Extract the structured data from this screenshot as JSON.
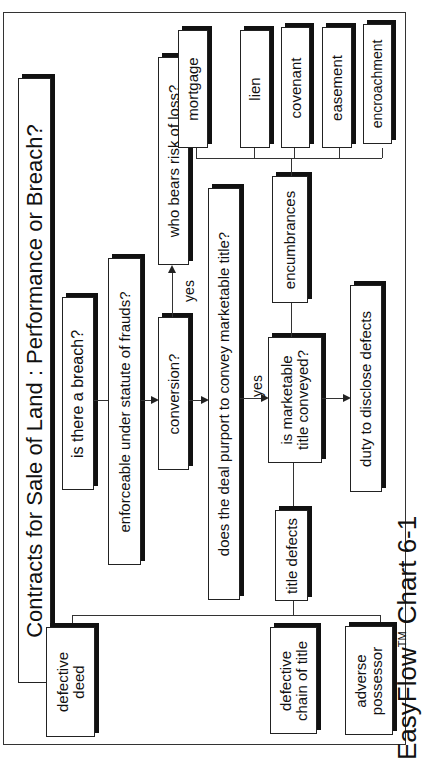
{
  "diagram": {
    "title": "Contracts for Sale of Land : Performance or Breach?",
    "orientation": "rotated -90deg (text reads bottom to top)",
    "nodes": {
      "breach": "is there a breach?",
      "statute_of_frauds": "enforceable under statute of frauds?",
      "conversion": "conversion?",
      "risk_of_loss": "who bears risk of loss?",
      "purport_marketable": "does the deal purport to convey marketable title?",
      "marketable_conveyed_line1": "is marketable",
      "marketable_conveyed_line2": "title conveyed?",
      "encumbrances": "encumbrances",
      "title_defects": "title defects",
      "duty_disclose": "duty to disclose defects",
      "encumbrance_types": [
        "mortgage",
        "lien",
        "covenant",
        "easement",
        "encroachment"
      ],
      "defect_types": [
        {
          "line1": "defective",
          "line2": "deed"
        },
        {
          "line1": "defective",
          "line2": "chain of title"
        },
        {
          "line1": "adverse",
          "line2": "possessor"
        }
      ]
    },
    "edge_labels": {
      "conversion_to_risk": "yes",
      "purport_to_conveyed": "yes"
    },
    "footer": {
      "brand": "EasyFlow",
      "trademark": "TM",
      "chart_label": "Chart 6-1"
    }
  }
}
